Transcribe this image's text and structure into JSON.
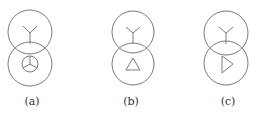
{
  "figures": [
    {
      "id": "a",
      "label": "(a)",
      "cx": 30,
      "top_cy": 32,
      "bottom_cy": 64,
      "r": 22,
      "primary_symbol": "wye",
      "secondary_symbol": "wye-in-circle"
    },
    {
      "id": "b",
      "label": "(b)",
      "cx": 133,
      "top_cy": 32,
      "bottom_cy": 64,
      "r": 21,
      "primary_symbol": "wye",
      "secondary_symbol": "delta"
    },
    {
      "id": "c",
      "label": "(c)",
      "cx": 226,
      "top_cy": 33,
      "bottom_cy": 63,
      "r": 22,
      "primary_symbol": "wye",
      "secondary_symbol": "open-triangle-right"
    }
  ],
  "colors": {
    "stroke": "#7a7a7a",
    "text": "#333333",
    "background": "#ffffff"
  }
}
